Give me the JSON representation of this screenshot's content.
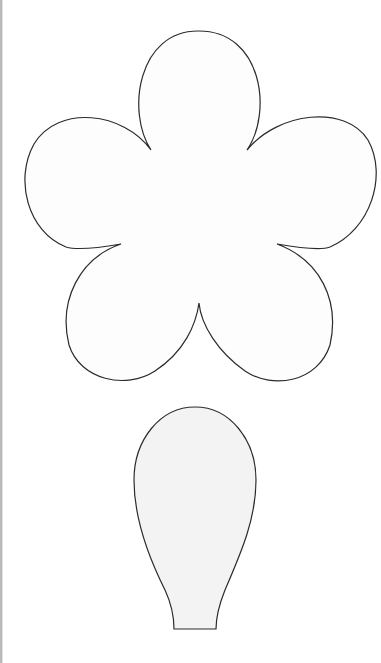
{
  "page": {
    "width": 381,
    "height": 663,
    "background": "#ffffff"
  },
  "shapes": {
    "flower": {
      "label": "five-petal flower template",
      "petal_count": 5,
      "fill": "#fdfdfd",
      "stroke": "#2b2b2b"
    },
    "petal": {
      "label": "single petal template",
      "fill": "#f3f3f3",
      "stroke": "#2b2b2b"
    }
  },
  "edges": {
    "left_border_color": "#b9b9b9"
  }
}
